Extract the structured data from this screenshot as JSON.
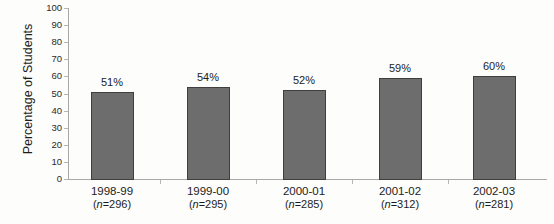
{
  "chart_data": {
    "type": "bar",
    "title": "",
    "ylabel": "Percentage of Students",
    "xlabel": "",
    "ylim": [
      0,
      100
    ],
    "ytick_step": 10,
    "ytick_labels": [
      "0",
      "10",
      "20",
      "30",
      "40",
      "50",
      "60",
      "70",
      "80",
      "90",
      "100"
    ],
    "categories": [
      "1998-99",
      "1999-00",
      "2000-01",
      "2001-02",
      "2002-03"
    ],
    "n_labels": [
      "(n=296)",
      "(n=295)",
      "(n=285)",
      "(n=312)",
      "(n=281)"
    ],
    "values": [
      51,
      54,
      52,
      59,
      60
    ],
    "bar_labels": [
      "51%",
      "54%",
      "52%",
      "59%",
      "60%"
    ],
    "legend": null,
    "grid": false,
    "colors": {
      "bar_fill": "#6d6d6d",
      "bar_border": "#3f3f3f",
      "axis": "#a9a9a9",
      "text": "#1c1c1c",
      "background": "#fdfdfb"
    }
  }
}
